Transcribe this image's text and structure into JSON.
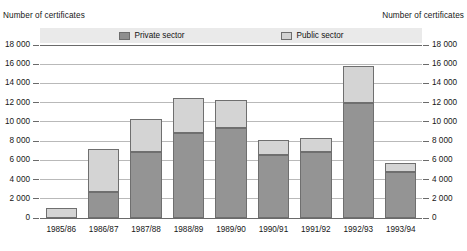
{
  "chart_data": {
    "type": "bar",
    "subtype": "stacked-vertical",
    "title": "",
    "xlabel": "",
    "ylabel": "Number of certificates",
    "ylabel_right": "Number of certificates",
    "categories": [
      "1985/86",
      "1986/87",
      "1987/88",
      "1988/89",
      "1989/90",
      "1990/91",
      "1991/92",
      "1992/93",
      "1993/94"
    ],
    "series": [
      {
        "name": "Private sector",
        "color": "#949494",
        "values": [
          0,
          2750,
          6900,
          8800,
          9400,
          6600,
          6900,
          12000,
          4800
        ]
      },
      {
        "name": "Public sector",
        "color": "#d4d4d4",
        "values": [
          1050,
          4450,
          3450,
          3700,
          2900,
          1500,
          1400,
          3800,
          900
        ]
      }
    ],
    "totals": [
      1050,
      7200,
      10350,
      12500,
      12300,
      8100,
      8300,
      15800,
      5700
    ],
    "ylim": [
      0,
      18000
    ],
    "ytick_step": 2000,
    "yticks": [
      "0",
      "2 000",
      "4 000",
      "6 000",
      "8 000",
      "10 000",
      "12 000",
      "14 000",
      "16 000",
      "18 000"
    ],
    "grid": true,
    "legend_position": "top-center",
    "legend_entries": [
      "Private sector",
      "Public sector"
    ]
  },
  "legend": {
    "private_label": "Private sector",
    "public_label": "Public sector",
    "private_color": "#949494",
    "public_color": "#d4d4d4"
  },
  "axes": {
    "left_title": "Number of certificates",
    "right_title": "Number of certificates"
  }
}
